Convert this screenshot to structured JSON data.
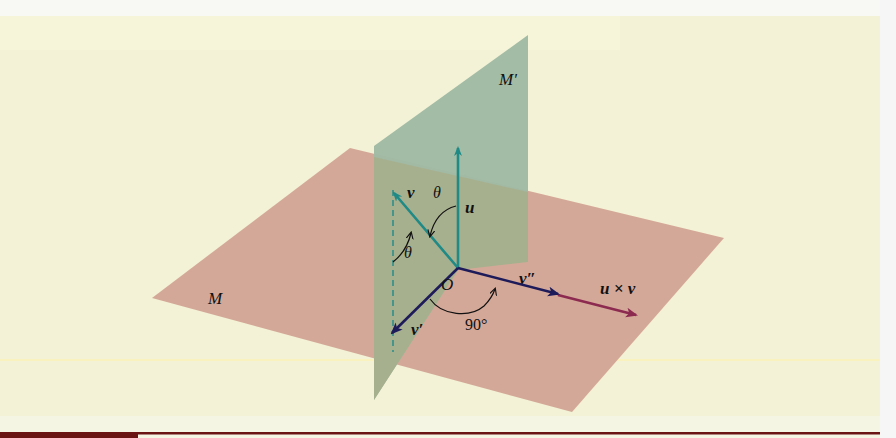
{
  "colors": {
    "page_bg": "#f5f5e4",
    "top_strip": "#f8f8f4",
    "panel_bg": "#f3f2d6",
    "plane_M": "#d4a898",
    "plane_M_prime": "#9fb9a3",
    "overlap": "#a7b08e",
    "teal_vector": "#1f8a86",
    "navy_vector": "#1e1b5a",
    "crimson_vector": "#8c2a4f",
    "arc": "#111111",
    "footer_dark": "#6b1414",
    "footer_line": "#6b1414"
  },
  "figure": {
    "planes": {
      "M": "M",
      "M_prime": "M′"
    },
    "vectors": {
      "u": "u",
      "v": "v",
      "v_prime": "v′",
      "v_double_prime": "v″",
      "cross": "u × v"
    },
    "labels": {
      "origin": "O",
      "theta_top": "θ",
      "theta_side": "θ",
      "right_angle": "90°"
    }
  }
}
